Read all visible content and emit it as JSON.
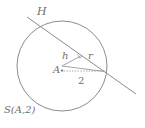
{
  "figure": {
    "type": "geometry-diagram",
    "canvas": {
      "width": 145,
      "height": 128,
      "background": "#ffffff"
    },
    "colors": {
      "stroke": "#8c8c8c",
      "label": "#6e6e6e",
      "dotted": "#9a9a9a",
      "background": "#ffffff"
    },
    "circle": {
      "name": "circle-S",
      "center_x": 62,
      "center_y": 66,
      "radius": 45,
      "center_label": "A",
      "radius_value": "2",
      "notation": "S(A,2)"
    },
    "line": {
      "name": "secant-line-H",
      "label": "H",
      "x1": 27,
      "y1": 17,
      "x2": 136,
      "y2": 94
    },
    "segments": {
      "perpendicular": {
        "name": "perpendicular-h",
        "label": "h",
        "x1": 62,
        "y1": 66,
        "x2": 81,
        "y2": 56
      },
      "radius_to_intersection": {
        "name": "radius-r",
        "label": "r",
        "x1": 62,
        "y1": 66,
        "x2": 104,
        "y2": 71
      },
      "radius_dotted": {
        "name": "radius-2",
        "label": "2",
        "x1": 62,
        "y1": 71,
        "x2": 107,
        "y2": 71
      }
    },
    "labels": {
      "line_label": "H",
      "height_label": "h",
      "radius_label": "r",
      "center_label": "A",
      "length_label": "2",
      "circle_notation": "S(A,2)"
    },
    "markers": {
      "right_angle": {
        "name": "right-angle-marker",
        "x": 80,
        "y": 59
      },
      "center_dot": {
        "name": "center-point-A",
        "x": 62,
        "y": 70
      }
    }
  }
}
